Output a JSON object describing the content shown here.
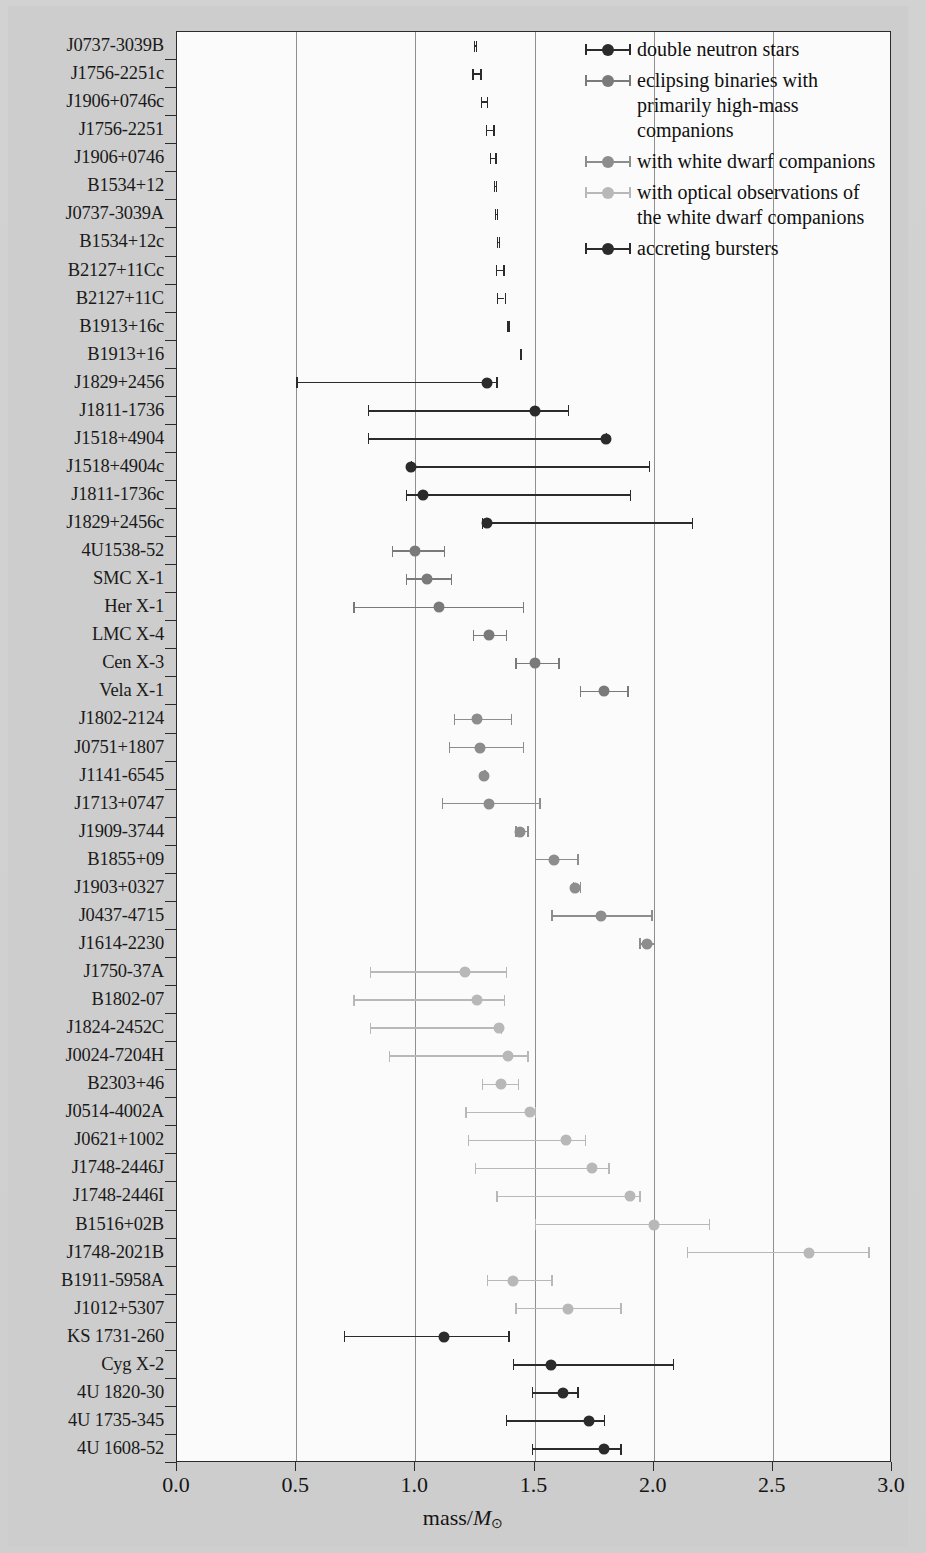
{
  "axis": {
    "xlabel_prefix": "mass/",
    "xlabel_symbol": "M",
    "xlabel_sub": "⊙",
    "xticks": [
      "0.0",
      "0.5",
      "1.0",
      "1.5",
      "2.0",
      "2.5",
      "3.0"
    ],
    "xlim": [
      0.0,
      3.0
    ]
  },
  "colors": {
    "double_neutron_stars": "#2b2b2b",
    "eclipsing_binaries": "#7a7a7a",
    "white_dwarf": "#8d8d8d",
    "white_dwarf_optical": "#b8b8b8",
    "accreting_bursters": "#2b2b2b",
    "plot_background": "#fbfbfb",
    "page_background": "#cdcdcd",
    "axis": "#2b2b2b",
    "gridline": "#8f8f8f"
  },
  "legend": {
    "items": [
      {
        "label": "double neutron stars",
        "color": "#2b2b2b",
        "group": "double_neutron_stars"
      },
      {
        "label": "eclipsing binaries with primarily high-mass companions",
        "color": "#7a7a7a",
        "group": "eclipsing_binaries"
      },
      {
        "label": "with white dwarf companions",
        "color": "#8d8d8d",
        "group": "white_dwarf"
      },
      {
        "label": "with optical observations of the white dwarf companions",
        "color": "#b8b8b8",
        "group": "white_dwarf_optical"
      },
      {
        "label": "accreting bursters",
        "color": "#2b2b2b",
        "group": "accreting_bursters"
      }
    ]
  },
  "chart_data": {
    "type": "scatter",
    "title": "",
    "xlabel": "mass/M⊙",
    "ylabel": "",
    "xlim": [
      0.0,
      3.0
    ],
    "grid": "vertical",
    "legend_position": "top-right",
    "categories": [
      "J0737-3039B",
      "J1756-2251c",
      "J1906+0746c",
      "J1756-2251",
      "J1906+0746",
      "B1534+12",
      "J0737-3039A",
      "B1534+12c",
      "B2127+11Cc",
      "B2127+11C",
      "B1913+16c",
      "B1913+16",
      "J1829+2456",
      "J1811-1736",
      "J1518+4904",
      "J1518+4904c",
      "J1811-1736c",
      "J1829+2456c",
      "4U1538-52",
      "SMC X-1",
      "Her X-1",
      "LMC X-4",
      "Cen X-3",
      "Vela X-1",
      "J1802-2124",
      "J0751+1807",
      "J1141-6545",
      "J1713+0747",
      "J1909-3744",
      "B1855+09",
      "J1903+0327",
      "J0437-4715",
      "J1614-2230",
      "J1750-37A",
      "B1802-07",
      "J1824-2452C",
      "J0024-7204H",
      "B2303+46",
      "J0514-4002A",
      "J0621+1002",
      "J1748-2446J",
      "J1748-2446I",
      "B1516+02B",
      "J1748-2021B",
      "B1911-5958A",
      "J1012+5307",
      "KS 1731-260",
      "Cyg X-2",
      "4U 1820-30",
      "4U 1735-345",
      "4U 1608-52"
    ],
    "points": [
      {
        "name": "J0737-3039B",
        "group": "double_neutron_stars",
        "mass": 1.249,
        "lo": 1.244,
        "hi": 1.254,
        "marker": "none"
      },
      {
        "name": "J1756-2251c",
        "group": "double_neutron_stars",
        "mass": 1.256,
        "lo": 1.239,
        "hi": 1.272,
        "marker": "none"
      },
      {
        "name": "J1906+0746c",
        "group": "double_neutron_stars",
        "mass": 1.287,
        "lo": 1.275,
        "hi": 1.3,
        "marker": "none"
      },
      {
        "name": "J1756-2251",
        "group": "double_neutron_stars",
        "mass": 1.312,
        "lo": 1.297,
        "hi": 1.327,
        "marker": "none"
      },
      {
        "name": "J1906+0746",
        "group": "double_neutron_stars",
        "mass": 1.323,
        "lo": 1.311,
        "hi": 1.335,
        "marker": "none"
      },
      {
        "name": "B1534+12",
        "group": "double_neutron_stars",
        "mass": 1.333,
        "lo": 1.33,
        "hi": 1.337,
        "marker": "none"
      },
      {
        "name": "J0737-3039A",
        "group": "double_neutron_stars",
        "mass": 1.337,
        "lo": 1.333,
        "hi": 1.341,
        "marker": "none"
      },
      {
        "name": "B1534+12c",
        "group": "double_neutron_stars",
        "mass": 1.346,
        "lo": 1.342,
        "hi": 1.35,
        "marker": "none"
      },
      {
        "name": "B2127+11Cc",
        "group": "double_neutron_stars",
        "mass": 1.354,
        "lo": 1.339,
        "hi": 1.369,
        "marker": "none"
      },
      {
        "name": "B2127+11C",
        "group": "double_neutron_stars",
        "mass": 1.358,
        "lo": 1.342,
        "hi": 1.374,
        "marker": "none"
      },
      {
        "name": "B1913+16c",
        "group": "double_neutron_stars",
        "mass": 1.389,
        "lo": 1.386,
        "hi": 1.392,
        "marker": "none"
      },
      {
        "name": "B1913+16",
        "group": "double_neutron_stars",
        "mass": 1.44,
        "lo": 1.437,
        "hi": 1.443,
        "marker": "none"
      },
      {
        "name": "J1829+2456",
        "group": "double_neutron_stars",
        "mass": 1.3,
        "lo": 0.5,
        "hi": 1.34,
        "marker": "dot"
      },
      {
        "name": "J1811-1736",
        "group": "double_neutron_stars",
        "mass": 1.5,
        "lo": 0.8,
        "hi": 1.64,
        "marker": "dot"
      },
      {
        "name": "J1518+4904",
        "group": "double_neutron_stars",
        "mass": 1.8,
        "lo": 0.8,
        "hi": 1.8,
        "marker": "dot"
      },
      {
        "name": "J1518+4904c",
        "group": "double_neutron_stars",
        "mass": 0.98,
        "lo": 0.98,
        "hi": 1.98,
        "marker": "dot"
      },
      {
        "name": "J1811-1736c",
        "group": "double_neutron_stars",
        "mass": 1.03,
        "lo": 0.96,
        "hi": 1.9,
        "marker": "dot"
      },
      {
        "name": "J1829+2456c",
        "group": "double_neutron_stars",
        "mass": 1.3,
        "lo": 1.28,
        "hi": 2.16,
        "marker": "dot"
      },
      {
        "name": "4U1538-52",
        "group": "eclipsing_binaries",
        "mass": 1.0,
        "lo": 0.9,
        "hi": 1.12,
        "marker": "dot"
      },
      {
        "name": "SMC X-1",
        "group": "eclipsing_binaries",
        "mass": 1.05,
        "lo": 0.96,
        "hi": 1.15,
        "marker": "dot"
      },
      {
        "name": "Her X-1",
        "group": "eclipsing_binaries",
        "mass": 1.1,
        "lo": 0.74,
        "hi": 1.45,
        "marker": "dot"
      },
      {
        "name": "LMC X-4",
        "group": "eclipsing_binaries",
        "mass": 1.31,
        "lo": 1.24,
        "hi": 1.38,
        "marker": "dot"
      },
      {
        "name": "Cen X-3",
        "group": "eclipsing_binaries",
        "mass": 1.5,
        "lo": 1.42,
        "hi": 1.6,
        "marker": "dot"
      },
      {
        "name": "Vela X-1",
        "group": "eclipsing_binaries",
        "mass": 1.79,
        "lo": 1.69,
        "hi": 1.89,
        "marker": "dot"
      },
      {
        "name": "J1802-2124",
        "group": "white_dwarf",
        "mass": 1.26,
        "lo": 1.16,
        "hi": 1.4,
        "marker": "dot"
      },
      {
        "name": "J0751+1807",
        "group": "white_dwarf",
        "mass": 1.27,
        "lo": 1.14,
        "hi": 1.45,
        "marker": "dot"
      },
      {
        "name": "J1141-6545",
        "group": "white_dwarf",
        "mass": 1.29,
        "lo": 1.29,
        "hi": 1.29,
        "marker": "dot"
      },
      {
        "name": "J1713+0747",
        "group": "white_dwarf",
        "mass": 1.31,
        "lo": 1.11,
        "hi": 1.52,
        "marker": "dot"
      },
      {
        "name": "J1909-3744",
        "group": "white_dwarf",
        "mass": 1.44,
        "lo": 1.42,
        "hi": 1.47,
        "marker": "dot"
      },
      {
        "name": "B1855+09",
        "group": "white_dwarf",
        "mass": 1.58,
        "lo": 1.5,
        "hi": 1.68,
        "marker": "dot"
      },
      {
        "name": "J1903+0327",
        "group": "white_dwarf",
        "mass": 1.67,
        "lo": 1.66,
        "hi": 1.69,
        "marker": "dot"
      },
      {
        "name": "J0437-4715",
        "group": "white_dwarf",
        "mass": 1.78,
        "lo": 1.57,
        "hi": 1.99,
        "marker": "dot"
      },
      {
        "name": "J1614-2230",
        "group": "white_dwarf",
        "mass": 1.97,
        "lo": 1.94,
        "hi": 2.0,
        "marker": "dot"
      },
      {
        "name": "J1750-37A",
        "group": "white_dwarf_optical",
        "mass": 1.21,
        "lo": 0.81,
        "hi": 1.38,
        "marker": "dot"
      },
      {
        "name": "B1802-07",
        "group": "white_dwarf_optical",
        "mass": 1.26,
        "lo": 0.74,
        "hi": 1.37,
        "marker": "dot"
      },
      {
        "name": "J1824-2452C",
        "group": "white_dwarf_optical",
        "mass": 1.35,
        "lo": 0.81,
        "hi": 1.36,
        "marker": "dot"
      },
      {
        "name": "J0024-7204H",
        "group": "white_dwarf_optical",
        "mass": 1.39,
        "lo": 0.89,
        "hi": 1.47,
        "marker": "dot"
      },
      {
        "name": "B2303+46",
        "group": "white_dwarf_optical",
        "mass": 1.36,
        "lo": 1.28,
        "hi": 1.43,
        "marker": "dot"
      },
      {
        "name": "J0514-4002A",
        "group": "white_dwarf_optical",
        "mass": 1.48,
        "lo": 1.21,
        "hi": 1.5,
        "marker": "dot"
      },
      {
        "name": "J0621+1002",
        "group": "white_dwarf_optical",
        "mass": 1.63,
        "lo": 1.22,
        "hi": 1.71,
        "marker": "dot"
      },
      {
        "name": "J1748-2446J",
        "group": "white_dwarf_optical",
        "mass": 1.74,
        "lo": 1.25,
        "hi": 1.81,
        "marker": "dot"
      },
      {
        "name": "J1748-2446I",
        "group": "white_dwarf_optical",
        "mass": 1.9,
        "lo": 1.34,
        "hi": 1.94,
        "marker": "dot"
      },
      {
        "name": "B1516+02B",
        "group": "white_dwarf_optical",
        "mass": 2.0,
        "lo": 1.5,
        "hi": 2.23,
        "marker": "dot"
      },
      {
        "name": "J1748-2021B",
        "group": "white_dwarf_optical",
        "mass": 2.65,
        "lo": 2.14,
        "hi": 2.9,
        "marker": "dot"
      },
      {
        "name": "B1911-5958A",
        "group": "white_dwarf_optical",
        "mass": 1.41,
        "lo": 1.3,
        "hi": 1.57,
        "marker": "dot"
      },
      {
        "name": "J1012+5307",
        "group": "white_dwarf_optical",
        "mass": 1.64,
        "lo": 1.42,
        "hi": 1.86,
        "marker": "dot"
      },
      {
        "name": "KS 1731-260",
        "group": "accreting_bursters",
        "mass": 1.12,
        "lo": 0.7,
        "hi": 1.39,
        "marker": "dot"
      },
      {
        "name": "Cyg X-2",
        "group": "accreting_bursters",
        "mass": 1.57,
        "lo": 1.41,
        "hi": 2.08,
        "marker": "dot"
      },
      {
        "name": "4U 1820-30",
        "group": "accreting_bursters",
        "mass": 1.62,
        "lo": 1.49,
        "hi": 1.68,
        "marker": "dot"
      },
      {
        "name": "4U 1735-345",
        "group": "accreting_bursters",
        "mass": 1.73,
        "lo": 1.38,
        "hi": 1.79,
        "marker": "dot"
      },
      {
        "name": "4U 1608-52",
        "group": "accreting_bursters",
        "mass": 1.79,
        "lo": 1.49,
        "hi": 1.86,
        "marker": "dot"
      }
    ]
  }
}
